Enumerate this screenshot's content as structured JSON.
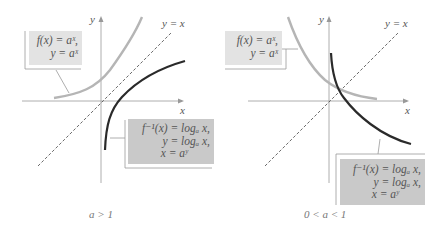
{
  "panels": [
    {
      "caption": "a > 1",
      "axis_x_label": "x",
      "axis_y_label": "y",
      "line_label": "y = x",
      "exp_box": {
        "line1": "f(x) = aˣ,",
        "line2": "y = aˣ"
      },
      "log_box": {
        "line1": "f⁻¹(x) = logₐ x,",
        "line2": "y = logₐ x,",
        "line3": "x = aʸ"
      }
    },
    {
      "caption": "0 < a < 1",
      "axis_x_label": "x",
      "axis_y_label": "y",
      "line_label": "y = x",
      "exp_box": {
        "line1": "f(x) = aˣ,",
        "line2": "y = aˣ"
      },
      "log_box": {
        "line1": "f⁻¹(x) = logₐ x,",
        "line2": "y = logₐ x,",
        "line3": "x = aʸ"
      }
    }
  ],
  "colors": {
    "exp_curve": "#b5b5b5",
    "log_curve": "#2a2a2a",
    "axis": "#888888",
    "dashed": "#444444",
    "box_light": "#e3e3e3",
    "box_dark": "#c9c9c9"
  }
}
